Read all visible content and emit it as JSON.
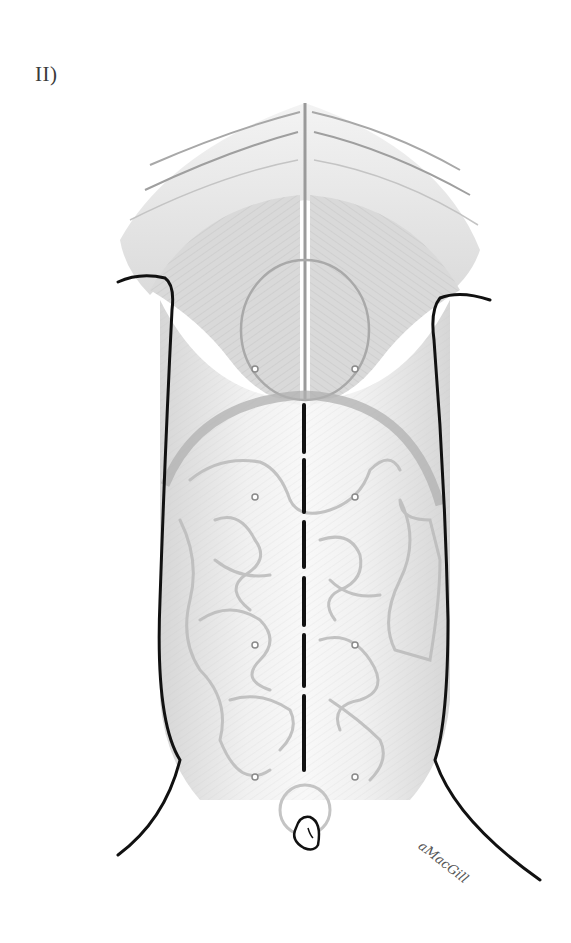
{
  "figure": {
    "panel_label": "II)",
    "signature": "aMacGill",
    "colors": {
      "outline": "#111111",
      "muscle_shading": "#c9c9c9",
      "organ_lines": "#b5b5b5",
      "incision": "#111111",
      "port_marker": "#8a8a8a",
      "background": "#ffffff"
    },
    "midline_incision": {
      "style": "dashed",
      "x": 304,
      "segments": [
        [
          405,
          452
        ],
        [
          460,
          512
        ],
        [
          522,
          567
        ],
        [
          578,
          625
        ],
        [
          635,
          686
        ],
        [
          696,
          770
        ]
      ]
    },
    "port_markers": [
      {
        "id": "port-upper-left",
        "x": 255,
        "y": 369
      },
      {
        "id": "port-upper-right",
        "x": 355,
        "y": 369
      },
      {
        "id": "port-mid-left",
        "x": 255,
        "y": 497
      },
      {
        "id": "port-mid-right",
        "x": 355,
        "y": 497
      },
      {
        "id": "port-lower-left",
        "x": 255,
        "y": 645
      },
      {
        "id": "port-lower-right",
        "x": 355,
        "y": 645
      },
      {
        "id": "port-pelvic-left",
        "x": 255,
        "y": 777
      },
      {
        "id": "port-pelvic-right",
        "x": 355,
        "y": 777
      }
    ]
  }
}
